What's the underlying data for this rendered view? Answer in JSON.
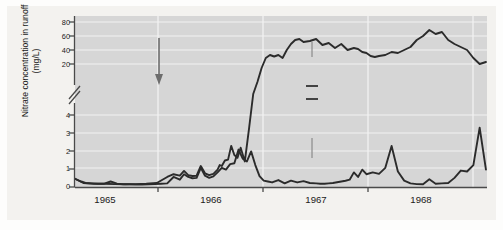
{
  "figure": {
    "background_color": "#f3f2ef",
    "plot_background_color": "#d6d6d6",
    "line_color": "#2b2b2b",
    "grid_color": "#f0f0f0"
  },
  "axes": {
    "y_title_line1": "Nitrate concentration in runoff",
    "y_title_line2": "(mg/L)",
    "y_ticks_upper": [
      "80",
      "60",
      "40",
      "20"
    ],
    "y_ticks_lower": [
      "4",
      "3",
      "2",
      "1",
      "0"
    ],
    "y_axis_break": true,
    "x_ticks": [
      "1965",
      "1966",
      "1967",
      "1968"
    ]
  },
  "annotations": {
    "completion": "Completion of\ntree cutting",
    "completion_line1": "Completion of",
    "completion_line2": "tree cutting",
    "deforested": "Deforested",
    "control": "Control"
  },
  "chart_data": {
    "type": "line",
    "title": "",
    "xlabel": "",
    "ylabel": "Nitrate concentration in runoff (mg/L)",
    "grid": true,
    "legend": "inline-labels",
    "axis_break": {
      "lower_range": [
        0,
        4.6
      ],
      "upper_range": [
        14,
        88
      ]
    },
    "x_tick_labels": [
      "1965",
      "1966",
      "1967",
      "1968"
    ],
    "x_tick_positions_year_start": [
      1965.0,
      1966.0,
      1967.0,
      1968.0
    ],
    "x_range": [
      1964.62,
      1968.55
    ],
    "series": [
      {
        "name": "Control",
        "x": [
          1964.62,
          1964.68,
          1964.72,
          1964.78,
          1964.84,
          1964.9,
          1964.96,
          1965.02,
          1965.08,
          1965.14,
          1965.2,
          1965.26,
          1965.32,
          1965.38,
          1965.44,
          1965.5,
          1965.56,
          1965.62,
          1965.66,
          1965.7,
          1965.74,
          1965.78,
          1965.82,
          1965.86,
          1965.9,
          1965.94,
          1965.98,
          1966.02,
          1966.06,
          1966.1,
          1966.14,
          1966.18,
          1966.22,
          1966.26,
          1966.3,
          1966.34,
          1966.38,
          1966.42,
          1966.46,
          1966.5,
          1966.56,
          1966.62,
          1966.68,
          1966.74,
          1966.8,
          1966.86,
          1966.92,
          1966.96,
          1967.0,
          1967.04,
          1967.08,
          1967.12,
          1967.16,
          1967.2,
          1967.24,
          1967.28,
          1967.32,
          1967.36,
          1967.4,
          1967.46,
          1967.52,
          1967.58,
          1967.64,
          1967.7,
          1967.76,
          1967.82,
          1967.88,
          1967.94,
          1968.0,
          1968.06,
          1968.12,
          1968.18,
          1968.24,
          1968.3,
          1968.36,
          1968.42,
          1968.48,
          1968.54
        ],
        "y": [
          0.45,
          0.3,
          0.22,
          0.2,
          0.18,
          0.18,
          0.3,
          0.18,
          0.15,
          0.15,
          0.14,
          0.14,
          0.15,
          0.16,
          0.18,
          0.2,
          0.55,
          0.4,
          0.7,
          0.55,
          0.48,
          0.5,
          1.05,
          0.62,
          0.5,
          0.58,
          0.8,
          1.05,
          0.95,
          1.25,
          1.3,
          2.05,
          1.55,
          1.4,
          1.95,
          1.2,
          0.6,
          0.35,
          0.3,
          0.25,
          0.38,
          0.2,
          0.35,
          0.25,
          0.32,
          0.22,
          0.2,
          0.18,
          0.18,
          0.2,
          0.22,
          0.26,
          0.3,
          0.34,
          0.4,
          0.8,
          0.55,
          0.95,
          0.7,
          0.8,
          0.72,
          1.05,
          2.25,
          0.85,
          0.35,
          0.2,
          0.16,
          0.15,
          0.42,
          0.18,
          0.2,
          0.22,
          0.5,
          0.9,
          0.85,
          1.2,
          3.25,
          0.95
        ],
        "note": "values in mg/L on lower (0-4) axis segment"
      },
      {
        "name": "Deforested",
        "x": [
          1964.62,
          1964.7,
          1964.8,
          1964.9,
          1965.0,
          1965.1,
          1965.2,
          1965.3,
          1965.4,
          1965.5,
          1965.56,
          1965.62,
          1965.66,
          1965.7,
          1965.74,
          1965.78,
          1965.82,
          1965.86,
          1965.9,
          1965.94,
          1965.98,
          1966.0,
          1966.02,
          1966.05,
          1966.08,
          1966.11,
          1966.14,
          1966.17,
          1966.2,
          1966.24,
          1966.28,
          1966.32,
          1966.36,
          1966.4,
          1966.44,
          1966.48,
          1966.52,
          1966.56,
          1966.6,
          1966.64,
          1966.68,
          1966.72,
          1966.76,
          1966.8,
          1966.86,
          1966.92,
          1966.98,
          1967.04,
          1967.1,
          1967.16,
          1967.22,
          1967.28,
          1967.32,
          1967.36,
          1967.4,
          1967.44,
          1967.48,
          1967.52,
          1967.58,
          1967.64,
          1967.7,
          1967.76,
          1967.82,
          1967.88,
          1967.94,
          1968.0,
          1968.06,
          1968.12,
          1968.18,
          1968.24,
          1968.3,
          1968.36,
          1968.42,
          1968.48,
          1968.54
        ],
        "y": [
          0.45,
          0.22,
          0.18,
          0.18,
          0.16,
          0.15,
          0.16,
          0.18,
          0.22,
          0.55,
          0.7,
          0.62,
          0.88,
          0.65,
          0.6,
          0.62,
          1.15,
          0.75,
          0.65,
          0.72,
          0.95,
          1.2,
          1.15,
          1.45,
          1.5,
          2.25,
          1.75,
          1.6,
          2.15,
          1.4,
          3.2,
          8.0,
          20.0,
          34.0,
          44.0,
          47.0,
          45.5,
          47.0,
          44.0,
          52.0,
          58.0,
          62.0,
          63.0,
          60.0,
          61.0,
          63.0,
          57.0,
          59.0,
          54.0,
          58.0,
          52.0,
          54.0,
          53.0,
          50.0,
          49.0,
          46.0,
          45.0,
          46.0,
          47.0,
          50.0,
          49.0,
          52.0,
          55.0,
          62.0,
          66.0,
          72.0,
          68.0,
          70.0,
          62.0,
          58.0,
          55.0,
          52.0,
          44.0,
          38.0,
          40.0
        ],
        "note": "rises from lower axis segment through axis break into upper (20-80) segment"
      }
    ]
  }
}
